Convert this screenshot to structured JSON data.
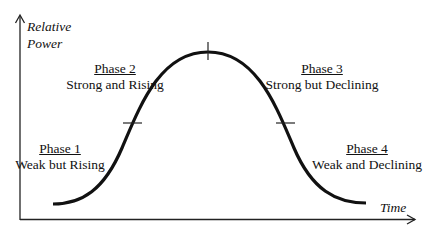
{
  "diagram": {
    "y_axis_label": [
      "Relative",
      "Power"
    ],
    "x_axis_label": "Time",
    "phases": [
      {
        "title": "Phase 1",
        "description": "Weak but Rising"
      },
      {
        "title": "Phase 2",
        "description": "Strong and Rising"
      },
      {
        "title": "Phase 3",
        "description": "Strong but Declining"
      },
      {
        "title": "Phase 4",
        "description": "Weak and Declining"
      }
    ],
    "curve": {
      "shape": "bell",
      "color": "#111111",
      "markers": [
        "rising inflection",
        "peak",
        "declining inflection"
      ]
    }
  }
}
